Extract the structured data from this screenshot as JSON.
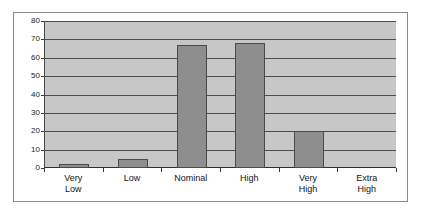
{
  "chart_data": {
    "type": "bar",
    "title": "",
    "subtitle": "",
    "xlabel": "",
    "ylabel": "",
    "categories": [
      "Very Low",
      "Low",
      "Nominal",
      "High",
      "Very High",
      "Extra High"
    ],
    "category_lines": [
      [
        "Very",
        "Low"
      ],
      [
        "Low"
      ],
      [
        "Nominal"
      ],
      [
        "High"
      ],
      [
        "Very",
        "High"
      ],
      [
        "Extra",
        "High"
      ]
    ],
    "values": [
      2,
      5,
      67,
      68,
      20,
      0
    ],
    "ylim": [
      0,
      80
    ],
    "yticks": [
      0,
      10,
      20,
      30,
      40,
      50,
      60,
      70,
      80
    ],
    "ytick_labels": [
      "0",
      "10",
      "20",
      "30",
      "40",
      "50",
      "60",
      "70",
      "80"
    ],
    "grid": true,
    "legend": false,
    "legend_position": "none",
    "colors": {
      "bar_fill": "#8e8e8e",
      "bar_outline": "#4a4a4a",
      "plot_background": "#c7c7c7",
      "gridline": "#4d4d4d",
      "axis": "#2e2e2e",
      "figure_border": "#8a8a8a",
      "text": "#141414",
      "page_background": "#ffffff"
    }
  }
}
